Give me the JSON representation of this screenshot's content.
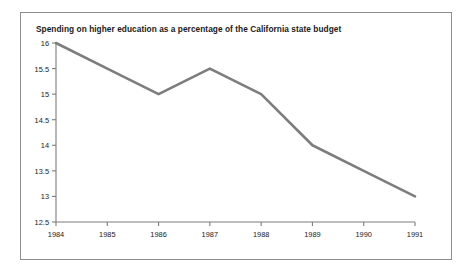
{
  "chart_data": {
    "type": "line",
    "title": "Spending on higher education as a percentage of the California state budget",
    "xlabel": "",
    "ylabel": "",
    "categories": [
      "1984",
      "1985",
      "1986",
      "1987",
      "1988",
      "1989",
      "1990",
      "1991"
    ],
    "x": [
      1984,
      1985,
      1986,
      1987,
      1988,
      1989,
      1990,
      1991
    ],
    "values": [
      16.0,
      15.5,
      15.0,
      15.5,
      15.0,
      14.0,
      13.5,
      13.0
    ],
    "series": [
      {
        "name": "Higher education share of state budget",
        "values": [
          16.0,
          15.5,
          15.0,
          15.5,
          15.0,
          14.0,
          13.5,
          13.0
        ]
      }
    ],
    "ylim": [
      12.5,
      16.0
    ],
    "xlim": [
      1984,
      1991
    ],
    "yticks": [
      12.5,
      13,
      13.5,
      14,
      14.5,
      15,
      15.5,
      16
    ],
    "ytick_labels": [
      "12.5",
      "13",
      "13.5",
      "14",
      "14.5",
      "15",
      "15.5",
      "16"
    ],
    "xtick_labels": [
      "1984",
      "1985",
      "1986",
      "1987",
      "1988",
      "1989",
      "1990",
      "1991"
    ],
    "grid": false,
    "legend": false,
    "legend_position": "none",
    "line_color": "#7d7d7d",
    "axis_color": "#7d7d7d",
    "frame_color": "#8e8e8e",
    "text_color": "#1a1a1a",
    "background": "#ffffff"
  }
}
